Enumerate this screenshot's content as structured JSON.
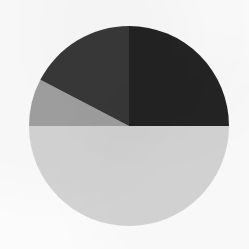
{
  "figure": {
    "background_color": "#fbfbfb",
    "width": 249,
    "height": 249
  },
  "chart_data": {
    "type": "pie",
    "title": "",
    "subtitle": "",
    "xlabel": "",
    "ylabel": "",
    "grid": false,
    "legend": "none",
    "labels": [
      "Segment 1",
      "Segment 2",
      "Segment 3",
      "Segment 4"
    ],
    "values": [
      25.0,
      50.0,
      7.6,
      17.4
    ],
    "value_unit": "percent",
    "colors": [
      "#232323",
      "#d4d4d4",
      "#a0a0a0",
      "#383838"
    ],
    "start_angle_deg": 90,
    "direction": "clockwise",
    "geometry": {
      "center_x": 129,
      "center_y": 126,
      "radius": 100
    },
    "slices": [
      {
        "label": "Segment 1",
        "value": 25.0,
        "color": "#232323",
        "start_angle_deg": 0,
        "end_angle_deg": 90,
        "sweep_deg": 90
      },
      {
        "label": "Segment 2",
        "value": 50.0,
        "color": "#d4d4d4",
        "start_angle_deg": 90,
        "end_angle_deg": 270,
        "sweep_deg": 180
      },
      {
        "label": "Segment 3",
        "value": 7.6,
        "color": "#a0a0a0",
        "start_angle_deg": 270,
        "end_angle_deg": 297.5,
        "sweep_deg": 27.5
      },
      {
        "label": "Segment 4",
        "value": 17.4,
        "color": "#383838",
        "start_angle_deg": 297.5,
        "end_angle_deg": 360,
        "sweep_deg": 62.5
      }
    ],
    "annotations": []
  }
}
